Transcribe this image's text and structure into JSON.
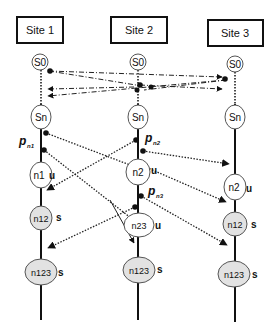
{
  "sites": [
    {
      "label": "Site 1"
    },
    {
      "label": "Site 2"
    },
    {
      "label": "Site 3"
    }
  ],
  "nodes": {
    "s0_1": "S0",
    "s0_2": "S0",
    "s0_3": "S0",
    "sn_1": "Sn",
    "sn_2": "Sn",
    "sn_3": "Sn",
    "n1": "n1",
    "n2_mid": "n2",
    "n2_right": "n2",
    "n12_left": "n12",
    "n23": "n23",
    "n12_right": "n12",
    "n123_left": "n123",
    "n123_mid": "n123",
    "n123_right": "n123"
  },
  "state_tags": {
    "n1": "u",
    "n2_mid": "u",
    "n2_right": "u",
    "n12_left": "s",
    "n23": "u",
    "n12_right": "s",
    "n123_left": "s",
    "n123_mid": "s",
    "n123_right": "s"
  },
  "proposals": {
    "pn1": {
      "p": "p",
      "sub": "n1"
    },
    "pn2": {
      "p": "p",
      "sub": "n2"
    },
    "pn3": {
      "p": "p",
      "sub": "n3"
    }
  },
  "colors": {
    "unstable_fill": "#ffffff",
    "stable_fill": "#e2e2e2",
    "line": "#111111"
  }
}
